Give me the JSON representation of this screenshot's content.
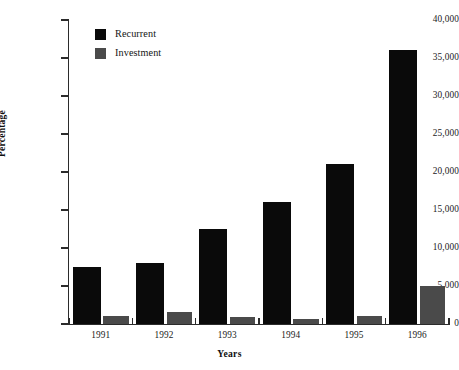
{
  "chart_data": {
    "type": "bar",
    "title": "",
    "xlabel": "Years",
    "ylabel": "Percentage",
    "categories": [
      "1991",
      "1992",
      "1993",
      "1994",
      "1995",
      "1996"
    ],
    "series": [
      {
        "name": "Recurrent",
        "color": "#0a0a0a",
        "values": [
          7500,
          8000,
          12500,
          16000,
          21000,
          36000
        ]
      },
      {
        "name": "Investment",
        "color": "#4a4a4a",
        "values": [
          1100,
          1600,
          900,
          600,
          1100,
          5000
        ]
      }
    ],
    "ylim": [
      0,
      40000
    ],
    "ytick_labels": [
      "0",
      "5,000",
      "10,000",
      "15,000",
      "20,000",
      "25,000",
      "30,000",
      "35,000",
      "40,000"
    ],
    "ytick_values": [
      0,
      5000,
      10000,
      15000,
      20000,
      25000,
      30000,
      35000,
      40000
    ],
    "grid": false,
    "legend_position": "top-left",
    "background_color": "#ffffff"
  },
  "legend": {
    "entries": [
      {
        "label": "Recurrent",
        "swatch": "#0a0a0a"
      },
      {
        "label": "Investment",
        "swatch": "#4a4a4a"
      }
    ]
  }
}
